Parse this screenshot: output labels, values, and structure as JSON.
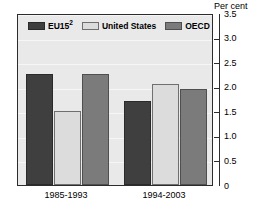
{
  "chart_data": {
    "type": "bar",
    "title": "",
    "subtitle": "",
    "xlabel": "",
    "ylabel": "Per cent",
    "ylim": [
      0,
      3.5
    ],
    "yticks": [
      "0",
      "0.5",
      "1.0",
      "1.5",
      "2.0",
      "2.5",
      "3.0",
      "3.5"
    ],
    "ytick_values": [
      0,
      0.5,
      1.0,
      1.5,
      2.0,
      2.5,
      3.0,
      3.5
    ],
    "grid": true,
    "legend_position": "top-left-inside",
    "categories": [
      "1985-1993",
      "1994-2003"
    ],
    "series": [
      {
        "name": "EU15",
        "footnote": "2",
        "color": "#3f3f3f",
        "values": [
          2.25,
          1.7
        ]
      },
      {
        "name": "United States",
        "footnote": "",
        "color": "#dcdcdc",
        "values": [
          1.5,
          2.05
        ]
      },
      {
        "name": "OECD",
        "footnote": "",
        "color": "#7b7b7b",
        "values": [
          2.25,
          1.95
        ]
      }
    ]
  },
  "axis": {
    "unit_label": "Per cent"
  },
  "legend": {
    "items": [
      {
        "label": "EU15",
        "sup": "2",
        "swatch": "series-eu15"
      },
      {
        "label": "United States",
        "sup": "",
        "swatch": "series-us"
      },
      {
        "label": "OECD",
        "sup": "",
        "swatch": "series-oecd"
      }
    ]
  },
  "colors": {
    "eu15": "#3f3f3f",
    "united_states": "#dcdcdc",
    "oecd": "#7b7b7b",
    "plot_background": "#e9e9e9",
    "axis": "#2c2c2c"
  }
}
